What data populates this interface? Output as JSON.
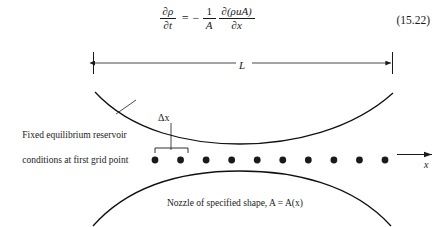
{
  "equation": {
    "lhs": {
      "numerator": "∂ρ",
      "denominator": "∂t"
    },
    "equals": "=",
    "minus": "−",
    "factor": {
      "numerator": "1",
      "denominator": "A"
    },
    "rhs": {
      "numerator": "∂(ρuA)",
      "denominator": "∂x"
    },
    "number": "(15.22)"
  },
  "figure": {
    "length_label": "L",
    "delta_x_label": "Δx",
    "reservoir_note_line1": "Fixed equilibrium reservoir",
    "reservoir_note_line2": "conditions at first grid point",
    "axis_label": "x",
    "nozzle_caption": "Nozzle of specified shape, A = A(x)",
    "grid_points": 10,
    "colors": {
      "ink": "#1a1a1a",
      "curve": "#111111",
      "background": "#ffffff"
    }
  }
}
